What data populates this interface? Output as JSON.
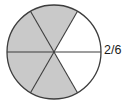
{
  "figure": {
    "kind": "fraction-circle-diagram",
    "label": "2/6",
    "colors": {
      "shaded_fill": "#c9c9c9",
      "unshaded_fill": "#ffffff",
      "outline": "#3d3d3d",
      "divider": "#3d3d3d",
      "label_text": "#1a1a1a",
      "background": "#ffffff"
    }
  },
  "chart_data": {
    "type": "pie",
    "title": "",
    "xlabel": "",
    "ylabel": "",
    "legend_position": "right",
    "grid": false,
    "total_slices": 6,
    "shaded_count": 4,
    "unshaded_count": 2,
    "fraction_unshaded": "2/6",
    "slice_angle_degrees": 60,
    "center": {
      "x": 54,
      "y": 52
    },
    "radius": 47,
    "categories": [
      "sector-1-upper-right",
      "sector-2-top",
      "sector-3-upper-left",
      "sector-4-lower-left",
      "sector-5-bottom",
      "sector-6-lower-right"
    ],
    "values": [
      1,
      1,
      1,
      1,
      1,
      1
    ],
    "series": [
      {
        "name": "shading",
        "values": [
          "unshaded",
          "shaded",
          "shaded",
          "shaded",
          "shaded",
          "unshaded"
        ]
      }
    ],
    "slices": [
      {
        "index": 1,
        "name": "sector-1-upper-right",
        "start_angle": 0,
        "end_angle": 60,
        "shaded": false
      },
      {
        "index": 2,
        "name": "sector-2-top",
        "start_angle": 60,
        "end_angle": 120,
        "shaded": true
      },
      {
        "index": 3,
        "name": "sector-3-upper-left",
        "start_angle": 120,
        "end_angle": 180,
        "shaded": true
      },
      {
        "index": 4,
        "name": "sector-4-lower-left",
        "start_angle": 180,
        "end_angle": 240,
        "shaded": true
      },
      {
        "index": 5,
        "name": "sector-5-bottom",
        "start_angle": 240,
        "end_angle": 300,
        "shaded": true
      },
      {
        "index": 6,
        "name": "sector-6-lower-right",
        "start_angle": 300,
        "end_angle": 360,
        "shaded": false
      }
    ],
    "annotations": [
      {
        "text": "2/6",
        "position": "right-of-circle",
        "x": 104,
        "y": 50
      }
    ]
  }
}
